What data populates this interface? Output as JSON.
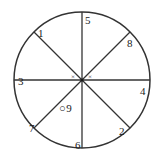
{
  "figure": {
    "kind": "circle-sector-diagram",
    "background_color": "#ffffff",
    "stroke_color": "#333333",
    "text_color": "#1a1a1a",
    "circle": {
      "center_x": 82,
      "center_y": 80,
      "radius": 68,
      "stroke_width": 1.4
    },
    "diameters": [
      {
        "name": "horizontal",
        "angle_deg": 0
      },
      {
        "name": "vertical",
        "angle_deg": 90
      },
      {
        "name": "diagonal-nesw",
        "angle_deg": 45
      },
      {
        "name": "diagonal-nwse",
        "angle_deg": 135
      }
    ],
    "labels": [
      {
        "id": "label-1",
        "text": "1",
        "x": 38,
        "y": 28,
        "angle_deg": 135,
        "position": "upper-left"
      },
      {
        "id": "label-5",
        "text": "5",
        "x": 85,
        "y": 15,
        "angle_deg": 90,
        "position": "top"
      },
      {
        "id": "label-8",
        "text": "8",
        "x": 127,
        "y": 38,
        "angle_deg": 45,
        "position": "upper-right"
      },
      {
        "id": "label-4",
        "text": "4",
        "x": 140,
        "y": 86,
        "angle_deg": 0,
        "position": "right"
      },
      {
        "id": "label-2",
        "text": "2",
        "x": 119,
        "y": 126,
        "angle_deg": 315,
        "position": "lower-right"
      },
      {
        "id": "label-6",
        "text": "6",
        "x": 75,
        "y": 140,
        "angle_deg": 270,
        "position": "bottom"
      },
      {
        "id": "label-7",
        "text": "7",
        "x": 29,
        "y": 123,
        "angle_deg": 225,
        "position": "lower-left"
      },
      {
        "id": "label-3",
        "text": "3",
        "x": 18,
        "y": 76,
        "angle_deg": 180,
        "position": "left"
      }
    ],
    "angle_marks": [
      {
        "id": "angle-mark-left",
        "text": "×",
        "x": 71,
        "y": 74
      },
      {
        "id": "angle-mark-right",
        "text": "×",
        "x": 88,
        "y": 74
      }
    ],
    "point_marker": {
      "id": "point-9",
      "symbol": "○",
      "text": "9",
      "x": 59,
      "y": 103
    }
  }
}
